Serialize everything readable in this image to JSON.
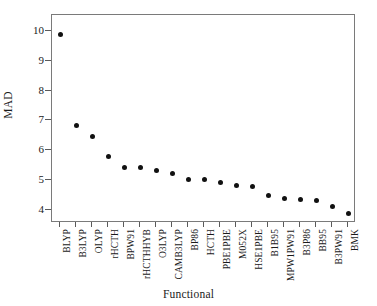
{
  "chart_data": {
    "type": "scatter",
    "title": "",
    "xlabel": "Functional",
    "ylabel": "MAD",
    "ylim": [
      3.55,
      10.55
    ],
    "yticks": [
      4,
      5,
      6,
      7,
      8,
      9,
      10
    ],
    "ytick_labels": [
      "4",
      "5",
      "6",
      "7",
      "8",
      "9",
      "10"
    ],
    "grid": false,
    "legend": null,
    "marker": "filled-circle",
    "marker_color": "#111111",
    "categories": [
      "BLYP",
      "B3LYP",
      "OLYP",
      "rHCTH",
      "BPW91",
      "rHCTHHYB",
      "O3LYP",
      "CAMB3LYP",
      "BP86",
      "HCTH",
      "PBE1PBE",
      "M052X",
      "HSE1PBE",
      "B1B95",
      "MPW1PW91",
      "B3P86",
      "BB95",
      "B3PW91",
      "BMK"
    ],
    "values": [
      9.88,
      6.82,
      6.45,
      5.78,
      5.43,
      5.41,
      5.32,
      5.23,
      5.03,
      5.0,
      4.91,
      4.82,
      4.79,
      4.46,
      4.39,
      4.34,
      4.32,
      4.09,
      3.87
    ]
  }
}
